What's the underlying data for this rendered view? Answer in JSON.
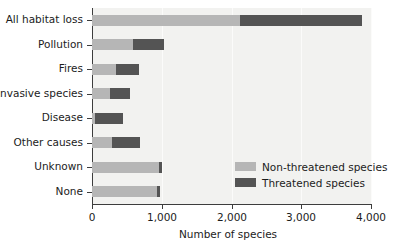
{
  "chart_data": {
    "type": "bar",
    "orientation": "horizontal",
    "stacked": true,
    "title": "",
    "xlabel": "Number of species",
    "ylabel": "",
    "xlim": [
      0,
      4000
    ],
    "xticks": [
      0,
      1000,
      2000,
      3000,
      4000
    ],
    "xticklabels": [
      "0",
      "1,000",
      "2,000",
      "3,000",
      "4,000"
    ],
    "grid": true,
    "grid_axis": "x",
    "legend_position": "inside-right-lower",
    "categories": [
      "All habitat loss",
      "Pollution",
      "Fires",
      "Invasive species",
      "Disease",
      "Other causes",
      "Unknown",
      "None"
    ],
    "series": [
      {
        "name": "Non-threatened species",
        "color": "#b6b6b6",
        "values": [
          2120,
          590,
          345,
          260,
          40,
          290,
          960,
          935
        ]
      },
      {
        "name": "Threatened species",
        "color": "#545454",
        "values": [
          1755,
          440,
          330,
          285,
          405,
          400,
          45,
          40
        ]
      }
    ],
    "totals": [
      3875,
      1030,
      675,
      545,
      445,
      690,
      1005,
      975
    ]
  },
  "legend": {
    "entries": [
      {
        "label": "Non-threatened species",
        "color": "#b6b6b6"
      },
      {
        "label": "Threatened species",
        "color": "#545454"
      }
    ]
  },
  "axis": {
    "x_title": "Number of species"
  }
}
